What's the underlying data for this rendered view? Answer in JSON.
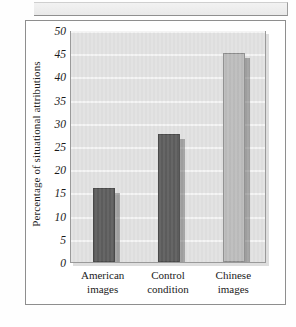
{
  "figure": {
    "kind": "scanned-textbook-bar-chart"
  },
  "chart_data": {
    "type": "bar",
    "title": "",
    "xlabel": "",
    "ylabel": "Percentage of situational attributions",
    "categories": [
      "American images",
      "Control condition",
      "Chinese images"
    ],
    "category_lines": [
      [
        "American",
        "images"
      ],
      [
        "Control",
        "condition"
      ],
      [
        "Chinese",
        "images"
      ]
    ],
    "values": [
      16,
      27.5,
      45
    ],
    "ylim": [
      0,
      50
    ],
    "ytick_step": 5,
    "yticks": [
      0,
      5,
      10,
      15,
      20,
      25,
      30,
      35,
      40,
      45,
      50
    ],
    "ytick_labels": [
      "0",
      "5",
      "10",
      "15",
      "20",
      "25",
      "30",
      "35",
      "40",
      "45",
      "50"
    ],
    "grid": true,
    "grid_orientation": "horizontal",
    "legend": "none",
    "bar_colors": [
      "#5e5e5e",
      "#5e5e5e",
      "#bdbdbd"
    ],
    "plot_background": "#e2e2e2",
    "gridline_color": "#f4f4f4",
    "axis_color": "#9a9a9a",
    "text_color": "#1a1a1a"
  }
}
